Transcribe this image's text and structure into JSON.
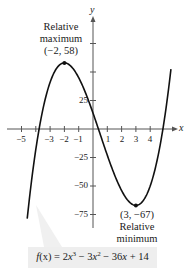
{
  "chart_data": {
    "type": "line",
    "title": "",
    "function": "f(x) = 2x^3 - 3x^2 - 36x + 14",
    "coefficients": [
      2,
      -3,
      -36,
      14
    ],
    "xlabel": "x",
    "ylabel": "y",
    "xlim": [
      -4.6,
      5.45
    ],
    "ylim": [
      -80,
      60
    ],
    "x_ticks": [
      -5,
      -4,
      -3,
      -2,
      -1,
      1,
      2,
      3,
      4
    ],
    "x_tick_labels": [
      "-5",
      "-3",
      "-2",
      "-1",
      "1",
      "2",
      "3",
      "4"
    ],
    "x_tick_labels_values": [
      -5,
      -3,
      -2,
      -1,
      1,
      2,
      3,
      4
    ],
    "y_ticks": [
      75,
      50,
      25,
      -25,
      -50,
      -75
    ],
    "y_tick_labels": [
      "25",
      "-25",
      "-50",
      "-75"
    ],
    "y_tick_labels_values": [
      25,
      -25,
      -50,
      -75
    ],
    "grid": false,
    "legend": "none",
    "annotations": [
      {
        "label": "Relative maximum",
        "point": [
          -2,
          58
        ],
        "text": "(−2, 58)"
      },
      {
        "label": "Relative minimum",
        "point": [
          3,
          -67
        ],
        "text": "(3, −67)"
      }
    ],
    "sample_points": [
      [
        -4.6,
        -78.6
      ],
      [
        -4,
        -14
      ],
      [
        -3,
        41
      ],
      [
        -2,
        58
      ],
      [
        -1,
        45
      ],
      [
        0,
        14
      ],
      [
        1,
        -23
      ],
      [
        2,
        -54
      ],
      [
        3,
        -67
      ],
      [
        4,
        -50
      ],
      [
        5,
        9
      ],
      [
        5.45,
        52.5
      ]
    ]
  },
  "labels": {
    "x_axis": "x",
    "y_axis": "y",
    "max_title_1": "Relative",
    "max_title_2": "maximum",
    "max_coords": "(−2, 58)",
    "min_coords": "(3, −67)",
    "min_title_1": "Relative",
    "min_title_2": "minimum",
    "formula_f": "f",
    "formula_rest_1": "(x) = 2",
    "formula_x1": "x",
    "formula_exp1": "3",
    "formula_rest_2": " − 3",
    "formula_x2": "x",
    "formula_exp2": "2",
    "formula_rest_3": " − 36",
    "formula_x3": "x",
    "formula_rest_4": " + 14"
  },
  "tick_labels_x": {
    "m5": "−5",
    "m3": "−3",
    "m2": "−2",
    "m1": "−1",
    "p1": "1",
    "p2": "2",
    "p3": "3",
    "p4": "4"
  },
  "tick_labels_y": {
    "p25": "25",
    "m25": "−25",
    "m50": "−50",
    "m75": "−75"
  },
  "colors": {
    "curve": "#111111",
    "axis": "#555555",
    "formula_bg": "#eeeeee"
  }
}
